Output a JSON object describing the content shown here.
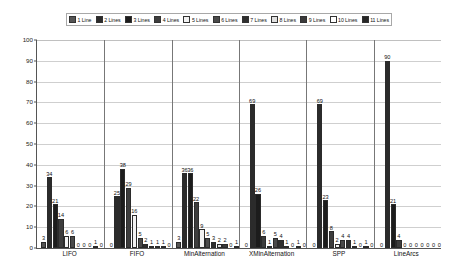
{
  "chart_data": {
    "type": "bar",
    "title": "",
    "subtitle": "",
    "xlabel": "",
    "ylabel": "",
    "ylim": [
      0,
      100
    ],
    "ytick_labels": [
      "0",
      "10",
      "20",
      "30",
      "40",
      "50",
      "60",
      "70",
      "80",
      "90",
      "100"
    ],
    "ytick_values": [
      0,
      10,
      20,
      30,
      40,
      50,
      60,
      70,
      80,
      90,
      100
    ],
    "grid": true,
    "legend_position": "top",
    "categories": [
      "LIFO",
      "FIFO",
      "MinAlternation",
      "XMinAlternation",
      "SPP",
      "LineArcs"
    ],
    "series": [
      {
        "name": "1 Line",
        "color": "#555555",
        "values": [
          3,
          0,
          3,
          0,
          0,
          0
        ]
      },
      {
        "name": "2 Lines",
        "color": "#2b2b2b",
        "values": [
          34,
          25,
          36,
          69,
          69,
          90
        ]
      },
      {
        "name": "3 Lines",
        "color": "#1c1c1c",
        "values": [
          21,
          38,
          36,
          26,
          23,
          21
        ]
      },
      {
        "name": "4 Lines",
        "color": "#3d3d3d",
        "values": [
          14,
          29,
          22,
          6,
          8,
          4
        ]
      },
      {
        "name": "5 Lines",
        "color": "#f2f2f2",
        "values": [
          6,
          16,
          9,
          1,
          2,
          0
        ]
      },
      {
        "name": "6 Lines",
        "color": "#4a4a4a",
        "values": [
          6,
          5,
          5,
          5,
          4,
          0
        ]
      },
      {
        "name": "7 Lines",
        "color": "#2f2f2f",
        "values": [
          0,
          2,
          3,
          4,
          4,
          0
        ]
      },
      {
        "name": "8 Lines",
        "color": "#e0e0e0",
        "values": [
          0,
          1,
          2,
          1,
          1,
          0
        ]
      },
      {
        "name": "9 Lines",
        "color": "#3a3a3a",
        "values": [
          0,
          1,
          2,
          0,
          0,
          0
        ]
      },
      {
        "name": "10 Lines",
        "color": "#ffffff",
        "values": [
          1,
          1,
          0,
          1,
          1,
          0
        ]
      },
      {
        "name": "11 Lines",
        "color": "#272727",
        "values": [
          0,
          0,
          1,
          0,
          0,
          0
        ]
      }
    ]
  },
  "legend": {
    "items": [
      {
        "label": "1 Line",
        "color": "#555555"
      },
      {
        "label": "2 Lines",
        "color": "#2b2b2b"
      },
      {
        "label": "3 Lines",
        "color": "#1c1c1c"
      },
      {
        "label": "4 Lines",
        "color": "#3d3d3d"
      },
      {
        "label": "5 Lines",
        "color": "#f2f2f2"
      },
      {
        "label": "6 Lines",
        "color": "#4a4a4a"
      },
      {
        "label": "7 Lines",
        "color": "#2f2f2f"
      },
      {
        "label": "8 Lines",
        "color": "#e0e0e0"
      },
      {
        "label": "9 Lines",
        "color": "#3a3a3a"
      },
      {
        "label": "10 Lines",
        "color": "#ffffff"
      },
      {
        "label": "11 Lines",
        "color": "#272727"
      }
    ]
  }
}
